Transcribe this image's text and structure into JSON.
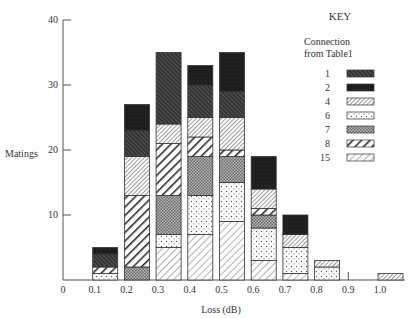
{
  "chart_data": {
    "type": "bar",
    "stacked": true,
    "title": "",
    "xlabel": "Loss (dB)",
    "ylabel": "Matings",
    "ylim": [
      0,
      40
    ],
    "yticks": [
      10,
      20,
      30,
      40
    ],
    "xticks": [
      "0",
      "0.1",
      "0.2",
      "0.3",
      "0.4",
      "0.5",
      "0.6",
      "0.7",
      "0.8",
      "0.9",
      "1.0"
    ],
    "categories": [
      "0.1",
      "0.2",
      "0.3",
      "0.4",
      "0.5",
      "0.6",
      "0.7",
      "0.8",
      "0.9",
      "1.0"
    ],
    "legend": {
      "title": "KEY",
      "subtitle_line1": "Connection",
      "subtitle_line2": "from Table1",
      "entries": [
        "1",
        "2",
        "4",
        "6",
        "7",
        "8",
        "15"
      ]
    },
    "series": [
      {
        "name": "15",
        "pattern": "light-diag",
        "values": [
          0,
          0,
          5,
          7,
          9,
          3,
          1,
          0,
          0,
          0
        ]
      },
      {
        "name": "6",
        "pattern": "dots",
        "values": [
          1,
          0,
          2,
          6,
          6,
          5,
          4,
          2,
          0,
          0
        ]
      },
      {
        "name": "7",
        "pattern": "checker",
        "values": [
          0,
          2,
          6,
          6,
          4,
          2,
          0,
          0,
          0,
          0
        ]
      },
      {
        "name": "8",
        "pattern": "bold-diag",
        "values": [
          1,
          11,
          8,
          3,
          1,
          1,
          0,
          0,
          0,
          0
        ]
      },
      {
        "name": "4",
        "pattern": "fine-diag",
        "values": [
          0,
          6,
          3,
          3,
          5,
          3,
          2,
          1,
          0,
          1
        ]
      },
      {
        "name": "1",
        "pattern": "dark-diag",
        "values": [
          2,
          4,
          11,
          5,
          4,
          0,
          0,
          0,
          0,
          0
        ]
      },
      {
        "name": "2",
        "pattern": "solid-dark",
        "values": [
          1,
          4,
          0,
          3,
          6,
          5,
          3,
          0,
          0,
          0
        ]
      }
    ],
    "totals": [
      5,
      27,
      35,
      33,
      35,
      19,
      10,
      3,
      0,
      1
    ],
    "grid": false,
    "legend_position": "top-right"
  }
}
